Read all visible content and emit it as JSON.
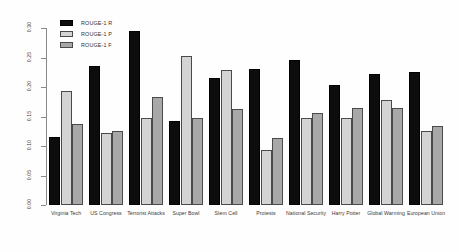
{
  "chart_data": {
    "type": "bar",
    "title": "",
    "xlabel": "",
    "ylabel": "",
    "ylim": [
      0,
      0.3
    ],
    "grid": false,
    "legend_position": "top-left",
    "categories": [
      "Virginia Tech",
      "US Congress",
      "Terrorist Attacks",
      "Super Bowl",
      "Stem Cell",
      "Protests",
      "National Security",
      "Harry Potter",
      "Global Warming",
      "European Union"
    ],
    "ytick_labels": [
      "0.00",
      "0.05",
      "0.10",
      "0.15",
      "0.20",
      "0.25",
      "0.30"
    ],
    "ytick_values": [
      0.0,
      0.05,
      0.1,
      0.15,
      0.2,
      0.25,
      0.3
    ],
    "series": [
      {
        "name": "ROUGE-1 R",
        "color": "#0d0d0d",
        "values": [
          0.115,
          0.235,
          0.295,
          0.142,
          0.215,
          0.23,
          0.245,
          0.203,
          0.222,
          0.225
        ]
      },
      {
        "name": "ROUGE-1 P",
        "color": "#d4d4d4",
        "values": [
          0.193,
          0.122,
          0.148,
          0.252,
          0.228,
          0.093,
          0.147,
          0.148,
          0.178,
          0.126
        ]
      },
      {
        "name": "ROUGE-1 F",
        "color": "#a8a8a8",
        "values": [
          0.137,
          0.126,
          0.183,
          0.148,
          0.163,
          0.113,
          0.156,
          0.165,
          0.165,
          0.134
        ]
      }
    ]
  }
}
